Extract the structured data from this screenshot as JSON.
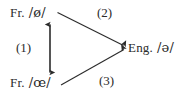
{
  "diagram": {
    "background_color": "#ffffff",
    "ink_color": "#2b2b2b",
    "nodes": [
      {
        "id": "fr-close-mid",
        "language": "Fr.",
        "phoneme": "/ø/",
        "position": "top-left"
      },
      {
        "id": "fr-open-mid",
        "language": "Fr.",
        "phoneme": "/œ/",
        "position": "bottom-left"
      },
      {
        "id": "eng-schwa",
        "language": "Eng.",
        "phoneme": "/ə/",
        "position": "right"
      }
    ],
    "edges": [
      {
        "id": "edge-1",
        "label": "(1)",
        "from": "fr-close-mid",
        "to": "fr-open-mid",
        "style": "double-headed-vertical"
      },
      {
        "id": "edge-2",
        "label": "(2)",
        "from": "fr-close-mid",
        "to": "eng-schwa",
        "style": "single-headed-diagonal"
      },
      {
        "id": "edge-3",
        "label": "(3)",
        "from": "fr-open-mid",
        "to": "eng-schwa",
        "style": "single-headed-diagonal"
      }
    ]
  }
}
